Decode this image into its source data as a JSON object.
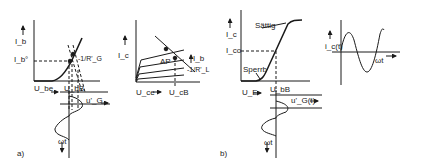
{
  "panel_a": {
    "caption": "a)",
    "input_char": {
      "y_label": "I_b",
      "y_point": "I_b°",
      "load_line": "-1/R'_G",
      "x_label": "U_be",
      "x_arrow": "→",
      "x_point": "U_bB",
      "signal": "u'_G",
      "time_axis": "ωt"
    },
    "output_char": {
      "y_label": "I_c",
      "param": "I_b",
      "operating_point": "AP",
      "load_line": "-1/R'_L",
      "x_label": "U_ce",
      "x_arrow": "→",
      "x_point": "U_cB"
    }
  },
  "panel_b": {
    "caption": "b)",
    "transfer_char": {
      "y_label": "I_c",
      "y_point": "I_co",
      "saturation": "Sättig",
      "cutoff": "Sperrb",
      "x_label": "U_E",
      "x_arrow": "→",
      "x_point": "U_bB",
      "signal": "u'_G(t)",
      "time_axis": "ωt"
    },
    "output_wave": {
      "y_label": "i_c(t)",
      "x_label": "ωt"
    }
  },
  "colors": {
    "line": "#1a1a1a",
    "background": "#ffffff"
  }
}
